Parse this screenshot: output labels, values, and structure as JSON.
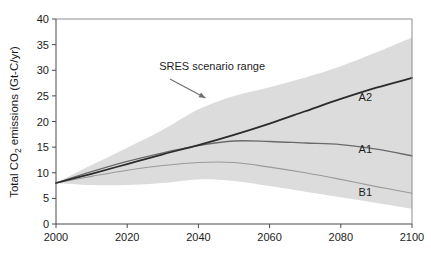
{
  "chart_data": {
    "type": "line",
    "title": "",
    "subtitle": "",
    "xlabel": "",
    "ylabel": "Total CO2 emissions (Gt-C/yr)",
    "ylabel_parts": {
      "pre": "Total CO",
      "sub": "2",
      "post": " emissions (Gt-C/yr)"
    },
    "xlim": [
      2000,
      2100
    ],
    "ylim": [
      0,
      40
    ],
    "xticks": [
      2000,
      2020,
      2040,
      2060,
      2080,
      2100
    ],
    "xtick_labels": [
      "2000",
      "2020",
      "2040",
      "2060",
      "2080",
      "2100"
    ],
    "yticks": [
      0,
      5,
      10,
      15,
      20,
      25,
      30,
      35,
      40
    ],
    "ytick_labels": [
      "0",
      "5",
      "10",
      "15",
      "20",
      "25",
      "30",
      "35",
      "40"
    ],
    "grid": false,
    "legend_position": "inline-right-labels",
    "x": [
      2000,
      2010,
      2020,
      2030,
      2040,
      2050,
      2060,
      2070,
      2080,
      2090,
      2100
    ],
    "series": [
      {
        "name": "A2",
        "label": "A2",
        "color": "#2b2b2b",
        "width": 1.8,
        "values": [
          8.0,
          9.8,
          11.7,
          13.6,
          15.4,
          17.4,
          19.6,
          22.0,
          24.4,
          26.6,
          28.5
        ],
        "label_x": 2085,
        "label_y": 24.0
      },
      {
        "name": "A1",
        "label": "A1",
        "color": "#6a6a6a",
        "width": 1.3,
        "values": [
          8.0,
          10.2,
          12.2,
          13.9,
          15.3,
          16.2,
          16.1,
          15.8,
          15.5,
          14.6,
          13.3
        ],
        "label_x": 2085,
        "label_y": 13.8
      },
      {
        "name": "B1",
        "label": "B1",
        "color": "#9a9a9a",
        "width": 1.1,
        "values": [
          8.0,
          9.3,
          10.5,
          11.4,
          12.0,
          12.0,
          11.1,
          10.0,
          8.7,
          7.3,
          6.0
        ],
        "label_x": 2085,
        "label_y": 5.4
      }
    ],
    "band": {
      "name": "SRES scenario range",
      "color": "#dcdcdc",
      "x": [
        2000,
        2010,
        2020,
        2030,
        2040,
        2050,
        2060,
        2070,
        2080,
        2090,
        2100
      ],
      "upper": [
        8.0,
        11.5,
        14.9,
        18.4,
        22.4,
        25.0,
        26.7,
        28.6,
        30.8,
        33.5,
        36.4
      ],
      "lower": [
        8.0,
        7.6,
        7.6,
        8.0,
        8.7,
        8.4,
        7.4,
        6.3,
        5.2,
        4.1,
        3.0
      ]
    },
    "annotations": [
      {
        "text": "SRES scenario range",
        "text_x": 2029,
        "text_y": 30.0,
        "arrow_from_x": 2032,
        "arrow_from_y": 28.3,
        "arrow_to_x": 2042,
        "arrow_to_y": 24.6
      }
    ]
  },
  "figure": {
    "background": "#ffffff",
    "axis_color": "#4a4a4a",
    "frame_color": "#8d8d8d",
    "text_color": "#1c1c1c"
  }
}
